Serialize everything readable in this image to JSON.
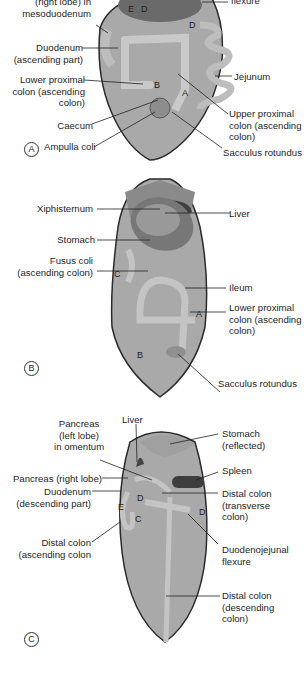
{
  "figure": {
    "panels": [
      {
        "id": "A",
        "marker": "A",
        "labels": {
          "pancreas_right": "(right lobe) in\nmesoduodenum",
          "flexure_top": "flexure",
          "duodenum": "Duodenum\n(ascending part)",
          "lower_proximal": "Lower proximal\ncolon (ascending\ncolon)",
          "caecum": "Caecum",
          "ampulla": "Ampulla coli",
          "jejunum": "Jejunum",
          "upper_proximal": "Upper proximal\ncolon (ascending\ncolon)",
          "sacculus": "Sacculus rotundus"
        },
        "letters": [
          "E",
          "D",
          "D",
          "B",
          "A"
        ]
      },
      {
        "id": "B",
        "marker": "B",
        "labels": {
          "xiphisternum": "Xiphisternum",
          "liver": "Liver",
          "stomach": "Stomach",
          "fusus": "Fusus coli\n(ascending colon)",
          "ileum": "Ileum",
          "lower_proximal": "Lower proximal\ncolon (ascending\ncolon)",
          "sacculus": "Sacculus rotundus"
        },
        "letters": [
          "C",
          "A",
          "B"
        ]
      },
      {
        "id": "C",
        "marker": "C",
        "labels": {
          "liver": "Liver",
          "pancreas_left": "Pancreas\n(left lobe)\nin omentum",
          "stomach": "Stomach\n(reflected)",
          "spleen": "Spleen",
          "pancreas_right": "Pancreas (right lobe)",
          "duodenum": "Duodenum\n(descending part)",
          "distal_transverse": "Distal colon\n(transverse\ncolon)",
          "distal_ascending": "Distal colon\n(ascending colon",
          "duodenojejunal": "Duodenojejunal\nflexure",
          "distal_descending": "Distal colon\n(descending\ncolon)"
        },
        "letters": [
          "E",
          "D",
          "D",
          "C"
        ]
      }
    ]
  },
  "colors": {
    "body_fill": "#a9a9a9",
    "outline": "#2b2b2b",
    "organ_dark": "#4a4a4a",
    "intestine": "#c4c4c4"
  }
}
